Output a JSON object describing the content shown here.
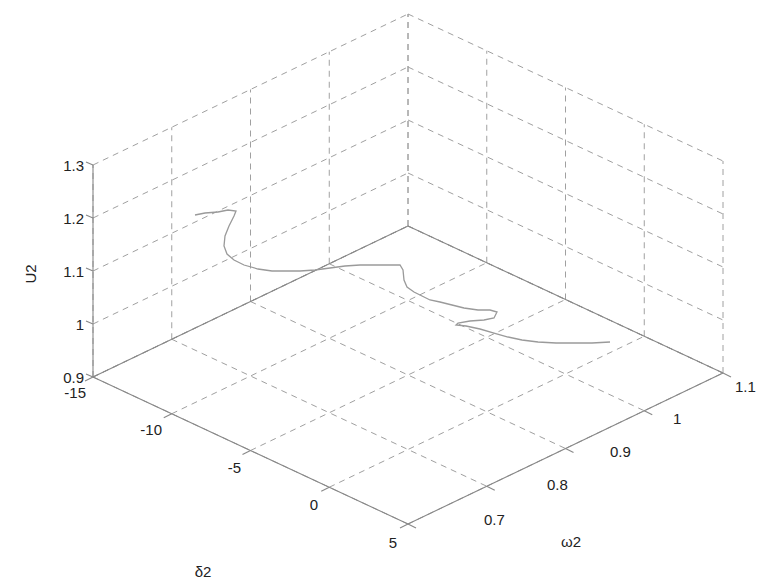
{
  "chart_data": {
    "type": "line3d",
    "title": "",
    "axes": {
      "x": {
        "label": "δ2",
        "range": [
          -15,
          5
        ],
        "ticks": [
          -15,
          -10,
          -5,
          0,
          5
        ]
      },
      "y": {
        "label": "ω2",
        "range": [
          0.7,
          1.1
        ],
        "ticks": [
          0.7,
          0.8,
          0.9,
          1,
          1.1
        ]
      },
      "z": {
        "label": "U2",
        "range": [
          0.9,
          1.3
        ],
        "ticks": [
          0.9,
          1,
          1.1,
          1.2,
          1.3
        ]
      }
    },
    "grid": true,
    "grid_style": "dashed",
    "line_color": "#9a9a9a",
    "grid_color": "#a0a0a0",
    "axis_color": "#888888",
    "text_color": "#222222",
    "trajectory_pixels": [
      [
        195,
        215
      ],
      [
        205,
        213
      ],
      [
        218,
        212
      ],
      [
        228,
        210
      ],
      [
        236,
        211
      ],
      [
        234,
        216
      ],
      [
        229,
        226
      ],
      [
        225,
        236
      ],
      [
        224,
        246
      ],
      [
        227,
        254
      ],
      [
        234,
        260
      ],
      [
        244,
        265
      ],
      [
        258,
        269
      ],
      [
        272,
        271
      ],
      [
        287,
        271
      ],
      [
        300,
        271
      ],
      [
        315,
        270
      ],
      [
        330,
        268
      ],
      [
        345,
        266
      ],
      [
        360,
        265
      ],
      [
        375,
        265
      ],
      [
        390,
        265
      ],
      [
        400,
        265
      ],
      [
        403,
        270
      ],
      [
        404,
        280
      ],
      [
        407,
        287
      ],
      [
        414,
        292
      ],
      [
        422,
        296
      ],
      [
        430,
        300
      ],
      [
        440,
        302
      ],
      [
        452,
        305
      ],
      [
        464,
        308
      ],
      [
        478,
        310
      ],
      [
        490,
        310
      ],
      [
        497,
        312
      ],
      [
        494,
        318
      ],
      [
        484,
        320
      ],
      [
        470,
        321
      ],
      [
        458,
        323
      ],
      [
        456,
        325
      ],
      [
        466,
        326
      ],
      [
        480,
        329
      ],
      [
        494,
        333
      ],
      [
        508,
        337
      ],
      [
        522,
        340
      ],
      [
        538,
        342
      ],
      [
        556,
        343
      ],
      [
        574,
        343
      ],
      [
        592,
        343
      ],
      [
        610,
        342
      ]
    ]
  },
  "labels": {
    "x_axis": "δ2",
    "y_axis": "ω2",
    "z_axis": "U2",
    "x_ticks": [
      "-15",
      "-10",
      "-5",
      "0",
      "5"
    ],
    "y_ticks": [
      "0.7",
      "0.8",
      "0.9",
      "1",
      "1.1"
    ],
    "z_ticks": [
      "0.9",
      "1",
      "1.1",
      "1.2",
      "1.3"
    ]
  }
}
